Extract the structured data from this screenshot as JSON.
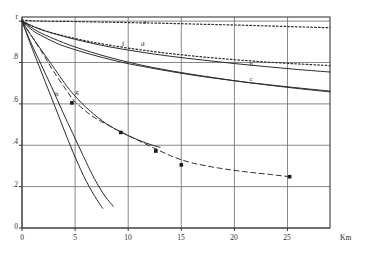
{
  "header_note": "",
  "chart_data": {
    "type": "line",
    "title": "",
    "xlabel": "Km",
    "ylabel": "r",
    "xlim": [
      0,
      29
    ],
    "ylim": [
      0,
      1.02
    ],
    "grid": true,
    "legend_position": "inline-curve-labels",
    "x_ticks": [
      "0",
      "5",
      "10",
      "15",
      "20",
      "25"
    ],
    "x_tick_values": [
      0,
      5,
      10,
      15,
      20,
      25
    ],
    "y_ticks": [
      "r",
      ".8",
      ".6",
      ".4",
      ".2",
      "0"
    ],
    "y_tick_values": [
      1.0,
      0.8,
      0.6,
      0.4,
      0.2,
      0.0
    ],
    "axis_unit_label": "Km",
    "series": [
      {
        "name": "a",
        "label": "a",
        "style": "dashed",
        "marker": "square",
        "label_xy": [
          12.6,
          0.375
        ],
        "x": [
          0.0,
          1.0,
          2.0,
          3.0,
          4.2,
          5.0,
          6.5,
          8.0,
          9.2,
          10.6,
          12.5,
          14.2,
          16.0,
          18.5,
          21.0,
          23.5,
          25.2
        ],
        "y": [
          1.0,
          0.92,
          0.84,
          0.755,
          0.665,
          0.61,
          0.545,
          0.5,
          0.468,
          0.432,
          0.385,
          0.345,
          0.315,
          0.29,
          0.272,
          0.258,
          0.248
        ],
        "marker_points": [
          [
            4.7,
            0.605
          ],
          [
            9.3,
            0.462
          ],
          [
            12.6,
            0.372
          ],
          [
            15.0,
            0.305
          ],
          [
            25.2,
            0.248
          ]
        ]
      },
      {
        "name": "b",
        "label": "b",
        "style": "solid",
        "label_xy": [
          21.6,
          0.79
        ],
        "x": [
          0.0,
          1.5,
          3.0,
          5.0,
          8.0,
          11.0,
          14.0,
          17.0,
          20.0,
          23.0,
          26.0,
          29.0
        ],
        "y": [
          1.0,
          0.965,
          0.94,
          0.912,
          0.878,
          0.852,
          0.83,
          0.812,
          0.795,
          0.78,
          0.766,
          0.754
        ]
      },
      {
        "name": "c",
        "label": "c",
        "style": "solid",
        "label_xy": [
          21.6,
          0.715
        ],
        "x": [
          0.0,
          1.5,
          3.0,
          5.0,
          8.0,
          11.0,
          14.0,
          17.0,
          20.0,
          23.0,
          26.0,
          29.0
        ],
        "y": [
          1.0,
          0.95,
          0.915,
          0.875,
          0.828,
          0.79,
          0.76,
          0.735,
          0.712,
          0.692,
          0.674,
          0.658
        ]
      },
      {
        "name": "d",
        "label": "d",
        "style": "solid",
        "label_xy": [
          11.4,
          0.885
        ],
        "x": [
          0.0,
          1.0,
          2.0,
          3.5,
          5.0,
          7.0,
          9.5,
          12.0,
          15.0,
          18.0,
          21.0,
          24.0,
          27.0,
          29.0
        ],
        "y": [
          1.0,
          0.955,
          0.925,
          0.888,
          0.862,
          0.832,
          0.8,
          0.775,
          0.748,
          0.725,
          0.705,
          0.688,
          0.672,
          0.662
        ]
      },
      {
        "name": "e",
        "label": "e",
        "style": "dotted",
        "label_xy": [
          11.6,
          0.99
        ],
        "x": [
          0.0,
          2.0,
          5.0,
          9.0,
          13.0,
          17.0,
          21.0,
          25.0,
          29.0
        ],
        "y": [
          1.005,
          1.0,
          0.998,
          0.994,
          0.99,
          0.985,
          0.98,
          0.974,
          0.968
        ]
      },
      {
        "name": "f",
        "label": "f",
        "style": "dotted",
        "label_xy": [
          9.6,
          0.885
        ],
        "x": [
          0.0,
          1.0,
          2.5,
          4.0,
          6.0,
          8.0,
          10.5,
          13.0,
          16.0,
          19.0,
          22.0,
          25.0,
          29.0
        ],
        "y": [
          1.0,
          0.975,
          0.948,
          0.928,
          0.905,
          0.886,
          0.866,
          0.849,
          0.832,
          0.818,
          0.806,
          0.796,
          0.785
        ]
      },
      {
        "name": "g",
        "label": "g",
        "style": "solid",
        "label_xy": [
          5.2,
          0.655
        ],
        "x": [
          0.0,
          0.8,
          1.8,
          2.8,
          3.8,
          4.7,
          6.0,
          7.5,
          9.0,
          10.5,
          12.0,
          13.0
        ],
        "y": [
          1.0,
          0.935,
          0.862,
          0.79,
          0.715,
          0.655,
          0.585,
          0.52,
          0.472,
          0.435,
          0.405,
          0.39
        ]
      },
      {
        "name": "h",
        "label": "h",
        "style": "solid",
        "label_xy": [
          3.3,
          0.645
        ],
        "x": [
          0.0,
          0.8,
          1.8,
          2.8,
          3.8,
          4.8,
          5.8,
          6.8,
          7.8,
          8.6
        ],
        "y": [
          1.0,
          0.9,
          0.79,
          0.68,
          0.565,
          0.455,
          0.345,
          0.24,
          0.155,
          0.105
        ]
      },
      {
        "name": "i",
        "label": "",
        "style": "solid",
        "x": [
          0.0,
          1.0,
          2.2,
          3.4,
          4.6,
          5.8,
          6.8,
          7.6
        ],
        "y": [
          1.0,
          0.862,
          0.705,
          0.548,
          0.392,
          0.252,
          0.158,
          0.095
        ]
      }
    ],
    "colors": {
      "axis": "#3a3a3a",
      "grid": "#6a6a6a",
      "curve": "#2b2b2b",
      "marker": "#1a1a1a"
    }
  }
}
